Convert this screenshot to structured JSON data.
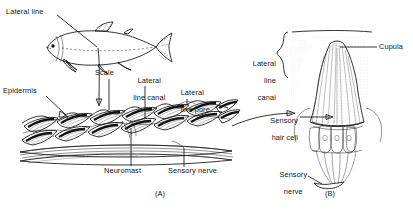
{
  "figure": {
    "panels": [
      {
        "id": "A",
        "caption": "(A)",
        "description": "Section of fish skin showing lateral line canal, scales and neuromasts"
      },
      {
        "id": "B",
        "caption": "(B)",
        "description": "Detail of a neuromast with cupula and sensory hair cells"
      }
    ]
  },
  "panel_a": {
    "labels": {
      "lateral_line": "Lateral line",
      "scale": "Scale",
      "lateral_line_canal": "Lateral\nline canal",
      "lateral_line_canal_l1": "Lateral",
      "lateral_line_canal_l2": "line canal",
      "lateral_line_pore": "Lateral\nline pore",
      "lateral_line_pore_l1": "Lateral",
      "lateral_line_pore_l2": "line pore",
      "epidermis": "Epidermis",
      "neuromast": "Neuromast",
      "sensory_nerve": "Sensory nerve"
    },
    "caption": "(A)"
  },
  "panel_b": {
    "labels": {
      "lateral_line_canal_l1": "Lateral",
      "lateral_line_canal_l2": "line",
      "lateral_line_canal_l3": "canal",
      "cupula": "Cupula",
      "sensory_hair_cell_l1": "Sensory",
      "sensory_hair_cell_l2": "hair cell",
      "sensory_nerve_l1": "Sensory",
      "sensory_nerve_l2": "nerve"
    },
    "caption": "(B)"
  },
  "colors": {
    "ink": "#111111",
    "background": "#ffffff",
    "shading": "#bdbdbd",
    "hatch": "#2b2b2b"
  }
}
